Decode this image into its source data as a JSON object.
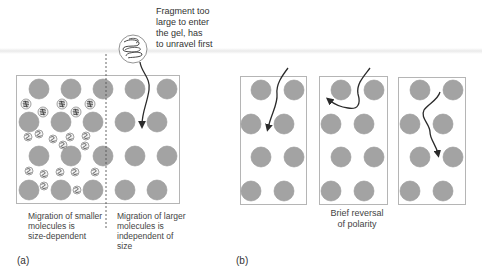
{
  "panel_a": {
    "tag": "(a)",
    "fragment_caption": "Fragment too\nlarge to enter\nthe gel, has\nto unravel first",
    "left_caption": "Migration of smaller\nmolecules is\nsize-dependent",
    "right_caption": "Migration of larger\nmolecules  is\nindependent of\nsize"
  },
  "panel_b": {
    "tag": "(b)",
    "middle_caption": "Brief reversal\nof polarity"
  },
  "colors": {
    "gel_bead": "#a3a3a3",
    "gel_bead_edge": "#8f8f8f",
    "box_border": "#b5b5b5",
    "arrow": "#2b2b2b",
    "text": "#444444"
  }
}
